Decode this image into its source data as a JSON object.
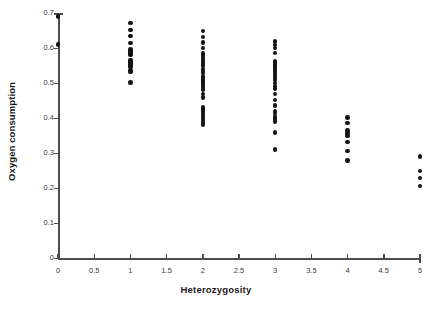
{
  "chart_data": {
    "type": "scatter",
    "title": "",
    "xlabel": "Heterozygosity",
    "ylabel": "Oxygen consumption",
    "xlim": [
      0,
      5
    ],
    "ylim": [
      0,
      0.7
    ],
    "xticks": [
      0,
      0.5,
      1,
      1.5,
      2,
      2.5,
      3,
      3.5,
      4,
      4.5,
      5
    ],
    "xtick_labels": [
      "0",
      "0.5",
      "1",
      "1.5",
      "2",
      "2.5",
      "3",
      "3.5",
      "4",
      "4.5",
      "5"
    ],
    "yticks": [
      0,
      0.1,
      0.2,
      0.3,
      0.4,
      0.5,
      0.6,
      0.7
    ],
    "ytick_labels": [
      "0",
      "0.1",
      "0.2",
      "0.3",
      "0.4",
      "0.5",
      "0.6",
      "0.7"
    ],
    "grid": false,
    "legend": null,
    "marker": "filled-circle",
    "marker_color": "#131313",
    "axis_color": "#4d4d4d",
    "background": "#ffffff",
    "series": [
      {
        "name": "Oxygen consumption",
        "points": [
          [
            0,
            0.69
          ],
          [
            0,
            0.61
          ],
          [
            1,
            0.672
          ],
          [
            1,
            0.652
          ],
          [
            1,
            0.634
          ],
          [
            1,
            0.614
          ],
          [
            1,
            0.596
          ],
          [
            1,
            0.592
          ],
          [
            1,
            0.588
          ],
          [
            1,
            0.584
          ],
          [
            1,
            0.58
          ],
          [
            1,
            0.566
          ],
          [
            1,
            0.562
          ],
          [
            1,
            0.558
          ],
          [
            1,
            0.554
          ],
          [
            1,
            0.55
          ],
          [
            1,
            0.546
          ],
          [
            1,
            0.536
          ],
          [
            1,
            0.532
          ],
          [
            1,
            0.502
          ],
          [
            2,
            0.648
          ],
          [
            2,
            0.632
          ],
          [
            2,
            0.616
          ],
          [
            2,
            0.6
          ],
          [
            2,
            0.586
          ],
          [
            2,
            0.578
          ],
          [
            2,
            0.572
          ],
          [
            2,
            0.566
          ],
          [
            2,
            0.558
          ],
          [
            2,
            0.55
          ],
          [
            2,
            0.54
          ],
          [
            2,
            0.534
          ],
          [
            2,
            0.528
          ],
          [
            2,
            0.518
          ],
          [
            2,
            0.51
          ],
          [
            2,
            0.504
          ],
          [
            2,
            0.498
          ],
          [
            2,
            0.49
          ],
          [
            2,
            0.482
          ],
          [
            2,
            0.468
          ],
          [
            2,
            0.458
          ],
          [
            2,
            0.43
          ],
          [
            2,
            0.424
          ],
          [
            2,
            0.418
          ],
          [
            2,
            0.412
          ],
          [
            2,
            0.406
          ],
          [
            2,
            0.4
          ],
          [
            2,
            0.394
          ],
          [
            2,
            0.388
          ],
          [
            2,
            0.382
          ],
          [
            3,
            0.618
          ],
          [
            3,
            0.608
          ],
          [
            3,
            0.6
          ],
          [
            3,
            0.586
          ],
          [
            3,
            0.562
          ],
          [
            3,
            0.556
          ],
          [
            3,
            0.55
          ],
          [
            3,
            0.544
          ],
          [
            3,
            0.538
          ],
          [
            3,
            0.532
          ],
          [
            3,
            0.526
          ],
          [
            3,
            0.52
          ],
          [
            3,
            0.514
          ],
          [
            3,
            0.508
          ],
          [
            3,
            0.5
          ],
          [
            3,
            0.492
          ],
          [
            3,
            0.484
          ],
          [
            3,
            0.468
          ],
          [
            3,
            0.452
          ],
          [
            3,
            0.436
          ],
          [
            3,
            0.42
          ],
          [
            3,
            0.414
          ],
          [
            3,
            0.406
          ],
          [
            3,
            0.398
          ],
          [
            3,
            0.39
          ],
          [
            3,
            0.358
          ],
          [
            3,
            0.31
          ],
          [
            4,
            0.402
          ],
          [
            4,
            0.386
          ],
          [
            4,
            0.364
          ],
          [
            4,
            0.356
          ],
          [
            4,
            0.348
          ],
          [
            4,
            0.332
          ],
          [
            4,
            0.306
          ],
          [
            4,
            0.278
          ],
          [
            5,
            0.29
          ],
          [
            5,
            0.248
          ],
          [
            5,
            0.228
          ],
          [
            5,
            0.206
          ]
        ]
      }
    ]
  }
}
